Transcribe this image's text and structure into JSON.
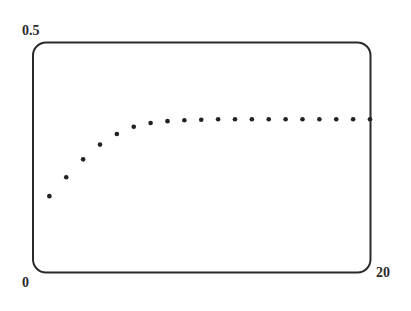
{
  "chart_data": {
    "type": "scatter",
    "title": "",
    "xlabel": "",
    "ylabel": "",
    "xlim": [
      0,
      20
    ],
    "ylim": [
      0,
      0.5
    ],
    "grid": false,
    "legend": null,
    "tick_labels": {
      "y_max": "0.5",
      "origin": "0",
      "x_max": "20"
    },
    "series": [
      {
        "name": "sequence",
        "marker": "dot",
        "color": "#222222",
        "x": [
          1,
          2,
          3,
          4,
          5,
          6,
          7,
          8,
          9,
          10,
          11,
          12,
          13,
          14,
          15,
          16,
          17,
          18,
          19,
          20
        ],
        "values": [
          0.166,
          0.207,
          0.246,
          0.278,
          0.301,
          0.317,
          0.325,
          0.329,
          0.331,
          0.332,
          0.333,
          0.333,
          0.333,
          0.333,
          0.333,
          0.333,
          0.333,
          0.333,
          0.333,
          0.333
        ]
      }
    ]
  },
  "labels": {
    "y_max": "0.5",
    "origin": "0",
    "x_max": "20"
  },
  "style": {
    "frame_color": "#2a2a2a",
    "dot_color": "#222222",
    "background": "#ffffff"
  }
}
